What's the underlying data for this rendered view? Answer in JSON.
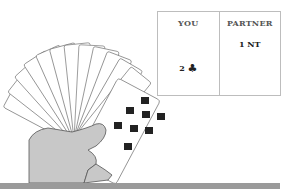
{
  "bidding": {
    "columns": [
      {
        "header": "YOU",
        "bid_value": "2",
        "bid_suit": "♣"
      },
      {
        "header": "PARTNER",
        "bid_value": "1 NT",
        "bid_suit": ""
      }
    ]
  },
  "hand": {
    "cards": [
      {
        "rank": "K",
        "suit": "♠"
      },
      {
        "rank": "J",
        "suit": "♠"
      },
      {
        "rank": "8",
        "suit": "♠"
      },
      {
        "rank": "7",
        "suit": "♠"
      },
      {
        "rank": "9",
        "suit": "♥"
      },
      {
        "rank": "10",
        "suit": "♥"
      },
      {
        "rank": "7",
        "suit": "♥"
      },
      {
        "rank": "6",
        "suit": "♥"
      },
      {
        "rank": "8",
        "suit": "♣"
      },
      {
        "rank": "6",
        "suit": "♣"
      },
      {
        "rank": "A",
        "suit": "♦"
      },
      {
        "rank": "J",
        "suit": "♦"
      },
      {
        "rank": "8",
        "suit": "♦"
      }
    ]
  },
  "colors": {
    "border": "#bdbdbd",
    "bar": "#9a9a9a",
    "hand": "#c8c8c8"
  }
}
